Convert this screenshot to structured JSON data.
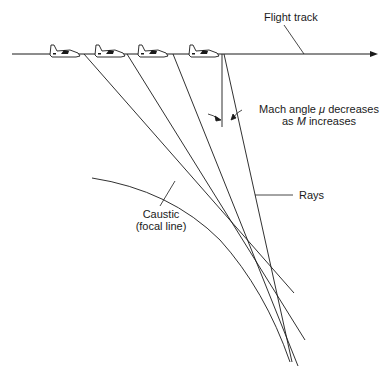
{
  "diagram": {
    "labels": {
      "flight_track": "Flight track",
      "mach_line1_prefix": "Mach angle ",
      "mach_symbol": "μ",
      "mach_line1_suffix": " decreases",
      "mach_line2_prefix": "as ",
      "mach_var": "M",
      "mach_line2_suffix": " increases",
      "rays": "Rays",
      "caustic_line1": "Caustic",
      "caustic_line2": "(focal line)"
    },
    "aircraft_count": 4,
    "colors": {
      "line": "#1a1a1a",
      "background": "#ffffff"
    }
  }
}
